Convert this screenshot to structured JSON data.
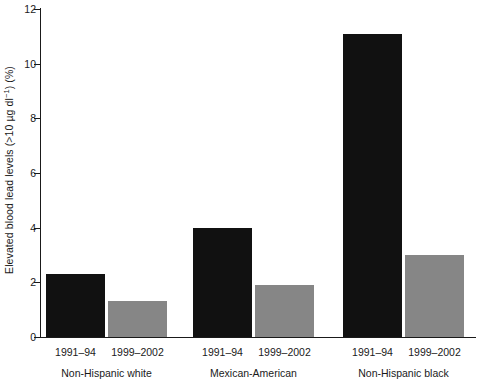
{
  "chart_data": {
    "type": "bar",
    "title": "",
    "xlabel": "",
    "ylabel": "Elevated blood lead levels (>10 µg dl⁻¹) (%)",
    "ylabel_parts": {
      "prefix": "Elevated blood lead levels (>10 µg dl",
      "superscript": "−1",
      "suffix": ") (%)"
    },
    "ylim": [
      0,
      12
    ],
    "ytick_labels": [
      "0",
      "2",
      "4",
      "6",
      "8",
      "10",
      "12"
    ],
    "ytick_values": [
      0,
      2,
      4,
      6,
      8,
      10,
      12
    ],
    "grid": false,
    "legend": "none",
    "categories": [
      "Non-Hispanic white",
      "Mexican-American",
      "Non-Hispanic black"
    ],
    "series": [
      {
        "name": "1991–94",
        "color": "#111111",
        "values": [
          2.3,
          4.0,
          11.1
        ]
      },
      {
        "name": "1999–2002",
        "color": "#868686",
        "values": [
          1.3,
          1.9,
          3.0
        ]
      }
    ],
    "groups": [
      {
        "label": "Non-Hispanic white",
        "bars": [
          {
            "period": "1991–94",
            "value": 2.3,
            "color": "#111111"
          },
          {
            "period": "1999–2002",
            "value": 1.3,
            "color": "#868686"
          }
        ]
      },
      {
        "label": "Mexican-American",
        "bars": [
          {
            "period": "1991–94",
            "value": 4.0,
            "color": "#111111"
          },
          {
            "period": "1999–2002",
            "value": 1.9,
            "color": "#868686"
          }
        ]
      },
      {
        "label": "Non-Hispanic black",
        "bars": [
          {
            "period": "1991–94",
            "value": 11.1,
            "color": "#111111"
          },
          {
            "period": "1999–2002",
            "value": 3.0,
            "color": "#868686"
          }
        ]
      }
    ]
  }
}
